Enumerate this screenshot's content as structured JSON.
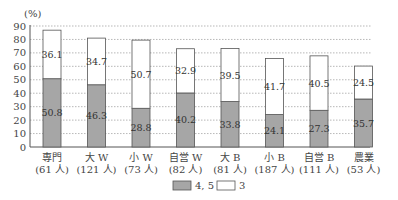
{
  "chart_data": {
    "type": "bar",
    "stacked": true,
    "title": "",
    "ylabel": "(%)",
    "xlabel": "",
    "ylim": [
      0,
      90
    ],
    "yticks": [
      0,
      10,
      20,
      30,
      40,
      50,
      60,
      70,
      80,
      90
    ],
    "grid": "horizontal dotted",
    "categories": [
      {
        "name": "専門",
        "n": "(61 人)"
      },
      {
        "name": "大 W",
        "n": "(121 人)"
      },
      {
        "name": "小 W",
        "n": "(73 人)"
      },
      {
        "name": "自営 W",
        "n": "(82 人)"
      },
      {
        "name": "大 B",
        "n": "(81 人)"
      },
      {
        "name": "小 B",
        "n": "(187 人)"
      },
      {
        "name": "自営 B",
        "n": "(111 人)"
      },
      {
        "name": "農業",
        "n": "(53 人)"
      }
    ],
    "series": [
      {
        "name": "4, 5",
        "color": "#a6a6a6",
        "values": [
          50.8,
          46.3,
          28.8,
          40.2,
          33.8,
          24.1,
          27.3,
          35.7
        ]
      },
      {
        "name": "3",
        "color": "#ffffff",
        "values": [
          36.1,
          34.7,
          50.7,
          32.9,
          39.5,
          41.7,
          40.5,
          24.5
        ]
      }
    ],
    "legend": {
      "position": "bottom-center",
      "entries": [
        "4, 5",
        "3"
      ]
    }
  }
}
